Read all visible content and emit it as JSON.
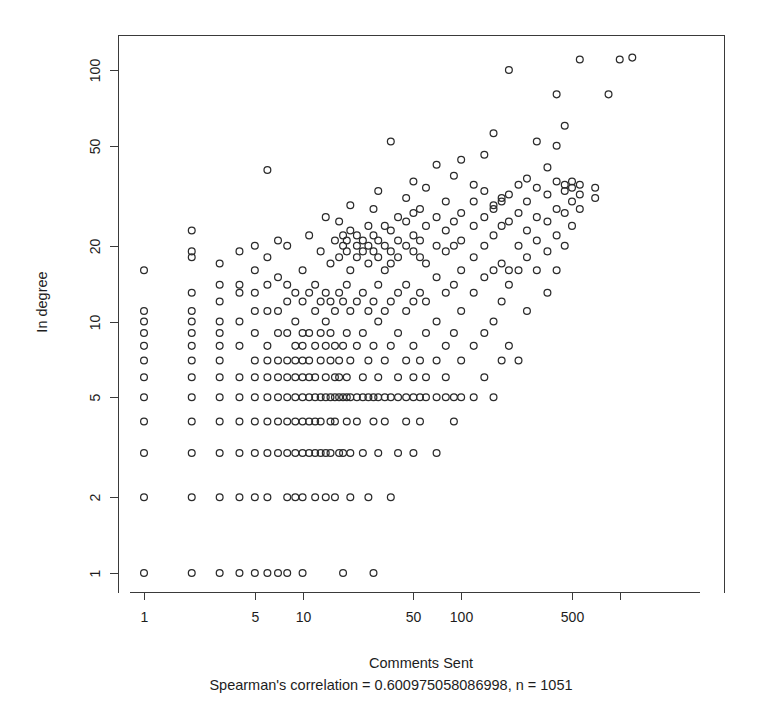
{
  "chart_data": {
    "type": "scatter",
    "title": "",
    "xlabel": "Comments Sent",
    "ylabel": "In degree",
    "subtitle": "Spearman's correlation = 0.600975058086998, n = 1051",
    "xscale": "log",
    "yscale": "log",
    "xlim": [
      0.8,
      1400
    ],
    "ylim": [
      0.85,
      145
    ],
    "xticks": [
      1,
      5,
      10,
      50,
      100,
      500
    ],
    "xtick_labels": [
      "1",
      "5",
      "10",
      "50",
      "100",
      "500"
    ],
    "yticks": [
      1,
      2,
      5,
      10,
      20,
      50,
      100
    ],
    "ytick_labels": [
      "1",
      "2",
      "5",
      "10",
      "20",
      "50",
      "100"
    ],
    "grid": false,
    "legend": false,
    "marker": "open-circle",
    "marker_color": "#2b2b2b",
    "n_points_reported": 1051,
    "spearman_correlation": 0.600975058086998,
    "points": [
      [
        1,
        1
      ],
      [
        1,
        2
      ],
      [
        1,
        3
      ],
      [
        1,
        4
      ],
      [
        1,
        5
      ],
      [
        1,
        6
      ],
      [
        1,
        7
      ],
      [
        1,
        8
      ],
      [
        1,
        9
      ],
      [
        1,
        10
      ],
      [
        1,
        11
      ],
      [
        1,
        16
      ],
      [
        2,
        1
      ],
      [
        2,
        2
      ],
      [
        2,
        3
      ],
      [
        2,
        4
      ],
      [
        2,
        5
      ],
      [
        2,
        6
      ],
      [
        2,
        7
      ],
      [
        2,
        8
      ],
      [
        2,
        9
      ],
      [
        2,
        10
      ],
      [
        2,
        11
      ],
      [
        2,
        13
      ],
      [
        2,
        18
      ],
      [
        2,
        19
      ],
      [
        2,
        23
      ],
      [
        3,
        1
      ],
      [
        3,
        2
      ],
      [
        3,
        3
      ],
      [
        3,
        4
      ],
      [
        3,
        5
      ],
      [
        3,
        6
      ],
      [
        3,
        7
      ],
      [
        3,
        8
      ],
      [
        3,
        9
      ],
      [
        3,
        10
      ],
      [
        3,
        12
      ],
      [
        3,
        14
      ],
      [
        3,
        17
      ],
      [
        4,
        1
      ],
      [
        4,
        2
      ],
      [
        4,
        3
      ],
      [
        4,
        4
      ],
      [
        4,
        5
      ],
      [
        4,
        6
      ],
      [
        4,
        8
      ],
      [
        4,
        10
      ],
      [
        4,
        13
      ],
      [
        4,
        14
      ],
      [
        4,
        19
      ],
      [
        5,
        1
      ],
      [
        5,
        2
      ],
      [
        5,
        3
      ],
      [
        5,
        4
      ],
      [
        5,
        5
      ],
      [
        5,
        6
      ],
      [
        5,
        7
      ],
      [
        5,
        9
      ],
      [
        5,
        11
      ],
      [
        5,
        13
      ],
      [
        5,
        16
      ],
      [
        5,
        20
      ],
      [
        6,
        1
      ],
      [
        6,
        2
      ],
      [
        6,
        3
      ],
      [
        6,
        4
      ],
      [
        6,
        5
      ],
      [
        6,
        6
      ],
      [
        6,
        7
      ],
      [
        6,
        8
      ],
      [
        6,
        11
      ],
      [
        6,
        14
      ],
      [
        6,
        18
      ],
      [
        6,
        40
      ],
      [
        7,
        1
      ],
      [
        7,
        3
      ],
      [
        7,
        4
      ],
      [
        7,
        5
      ],
      [
        7,
        6
      ],
      [
        7,
        7
      ],
      [
        7,
        9
      ],
      [
        7,
        11
      ],
      [
        7,
        15
      ],
      [
        7,
        21
      ],
      [
        8,
        1
      ],
      [
        8,
        2
      ],
      [
        8,
        3
      ],
      [
        8,
        4
      ],
      [
        8,
        5
      ],
      [
        8,
        6
      ],
      [
        8,
        7
      ],
      [
        8,
        9
      ],
      [
        8,
        12
      ],
      [
        8,
        14
      ],
      [
        8,
        20
      ],
      [
        9,
        2
      ],
      [
        9,
        3
      ],
      [
        9,
        4
      ],
      [
        9,
        5
      ],
      [
        9,
        6
      ],
      [
        9,
        7
      ],
      [
        9,
        8
      ],
      [
        9,
        10
      ],
      [
        9,
        13
      ],
      [
        10,
        1
      ],
      [
        10,
        2
      ],
      [
        10,
        3
      ],
      [
        10,
        4
      ],
      [
        10,
        5
      ],
      [
        10,
        6
      ],
      [
        10,
        7
      ],
      [
        10,
        8
      ],
      [
        10,
        9
      ],
      [
        10,
        12
      ],
      [
        10,
        16
      ],
      [
        11,
        3
      ],
      [
        11,
        4
      ],
      [
        11,
        5
      ],
      [
        11,
        6
      ],
      [
        11,
        7
      ],
      [
        11,
        9
      ],
      [
        11,
        13
      ],
      [
        11,
        22
      ],
      [
        12,
        2
      ],
      [
        12,
        3
      ],
      [
        12,
        4
      ],
      [
        12,
        5
      ],
      [
        12,
        6
      ],
      [
        12,
        8
      ],
      [
        12,
        11
      ],
      [
        12,
        14
      ],
      [
        13,
        3
      ],
      [
        13,
        4
      ],
      [
        13,
        5
      ],
      [
        13,
        7
      ],
      [
        13,
        9
      ],
      [
        13,
        12
      ],
      [
        13,
        19
      ],
      [
        14,
        2
      ],
      [
        14,
        3
      ],
      [
        14,
        5
      ],
      [
        14,
        6
      ],
      [
        14,
        8
      ],
      [
        14,
        10
      ],
      [
        14,
        13
      ],
      [
        14,
        26
      ],
      [
        15,
        3
      ],
      [
        15,
        4
      ],
      [
        15,
        5
      ],
      [
        15,
        7
      ],
      [
        15,
        9
      ],
      [
        15,
        12
      ],
      [
        15,
        17
      ],
      [
        16,
        2
      ],
      [
        16,
        4
      ],
      [
        16,
        5
      ],
      [
        16,
        6
      ],
      [
        16,
        8
      ],
      [
        16,
        11
      ],
      [
        16,
        21
      ],
      [
        17,
        3
      ],
      [
        17,
        5
      ],
      [
        17,
        6
      ],
      [
        17,
        7
      ],
      [
        17,
        13
      ],
      [
        17,
        18
      ],
      [
        17,
        25
      ],
      [
        18,
        1
      ],
      [
        18,
        3
      ],
      [
        18,
        5
      ],
      [
        18,
        8
      ],
      [
        18,
        12
      ],
      [
        18,
        20
      ],
      [
        18,
        22
      ],
      [
        19,
        4
      ],
      [
        19,
        5
      ],
      [
        19,
        6
      ],
      [
        19,
        9
      ],
      [
        19,
        14
      ],
      [
        19,
        19
      ],
      [
        19,
        21
      ],
      [
        20,
        2
      ],
      [
        20,
        3
      ],
      [
        20,
        5
      ],
      [
        20,
        7
      ],
      [
        20,
        11
      ],
      [
        20,
        16
      ],
      [
        20,
        23
      ],
      [
        20,
        29
      ],
      [
        22,
        4
      ],
      [
        22,
        5
      ],
      [
        22,
        8
      ],
      [
        22,
        12
      ],
      [
        22,
        18
      ],
      [
        22,
        20
      ],
      [
        22,
        22
      ],
      [
        24,
        3
      ],
      [
        24,
        5
      ],
      [
        24,
        6
      ],
      [
        24,
        9
      ],
      [
        24,
        13
      ],
      [
        24,
        19
      ],
      [
        24,
        21
      ],
      [
        26,
        2
      ],
      [
        26,
        5
      ],
      [
        26,
        7
      ],
      [
        26,
        11
      ],
      [
        26,
        17
      ],
      [
        26,
        20
      ],
      [
        26,
        24
      ],
      [
        28,
        1
      ],
      [
        28,
        4
      ],
      [
        28,
        5
      ],
      [
        28,
        8
      ],
      [
        28,
        12
      ],
      [
        28,
        19
      ],
      [
        28,
        22
      ],
      [
        28,
        28
      ],
      [
        30,
        3
      ],
      [
        30,
        5
      ],
      [
        30,
        6
      ],
      [
        30,
        10
      ],
      [
        30,
        14
      ],
      [
        30,
        18
      ],
      [
        30,
        21
      ],
      [
        30,
        33
      ],
      [
        33,
        4
      ],
      [
        33,
        5
      ],
      [
        33,
        7
      ],
      [
        33,
        11
      ],
      [
        33,
        16
      ],
      [
        33,
        20
      ],
      [
        33,
        24
      ],
      [
        36,
        2
      ],
      [
        36,
        5
      ],
      [
        36,
        8
      ],
      [
        36,
        12
      ],
      [
        36,
        17
      ],
      [
        36,
        19
      ],
      [
        36,
        23
      ],
      [
        36,
        52
      ],
      [
        40,
        3
      ],
      [
        40,
        5
      ],
      [
        40,
        6
      ],
      [
        40,
        9
      ],
      [
        40,
        13
      ],
      [
        40,
        18
      ],
      [
        40,
        21
      ],
      [
        40,
        26
      ],
      [
        45,
        4
      ],
      [
        45,
        5
      ],
      [
        45,
        7
      ],
      [
        45,
        11
      ],
      [
        45,
        14
      ],
      [
        45,
        20
      ],
      [
        45,
        25
      ],
      [
        45,
        31
      ],
      [
        50,
        3
      ],
      [
        50,
        5
      ],
      [
        50,
        6
      ],
      [
        50,
        8
      ],
      [
        50,
        12
      ],
      [
        50,
        19
      ],
      [
        50,
        22
      ],
      [
        50,
        27
      ],
      [
        50,
        36
      ],
      [
        55,
        4
      ],
      [
        55,
        5
      ],
      [
        55,
        7
      ],
      [
        55,
        13
      ],
      [
        55,
        18
      ],
      [
        55,
        21
      ],
      [
        55,
        28
      ],
      [
        60,
        5
      ],
      [
        60,
        6
      ],
      [
        60,
        9
      ],
      [
        60,
        12
      ],
      [
        60,
        17
      ],
      [
        60,
        24
      ],
      [
        60,
        34
      ],
      [
        70,
        3
      ],
      [
        70,
        5
      ],
      [
        70,
        7
      ],
      [
        70,
        10
      ],
      [
        70,
        15
      ],
      [
        70,
        20
      ],
      [
        70,
        26
      ],
      [
        70,
        42
      ],
      [
        80,
        5
      ],
      [
        80,
        6
      ],
      [
        80,
        8
      ],
      [
        80,
        13
      ],
      [
        80,
        19
      ],
      [
        80,
        23
      ],
      [
        80,
        30
      ],
      [
        90,
        4
      ],
      [
        90,
        5
      ],
      [
        90,
        9
      ],
      [
        90,
        14
      ],
      [
        90,
        20
      ],
      [
        90,
        25
      ],
      [
        90,
        38
      ],
      [
        100,
        5
      ],
      [
        100,
        7
      ],
      [
        100,
        11
      ],
      [
        100,
        16
      ],
      [
        100,
        21
      ],
      [
        100,
        27
      ],
      [
        100,
        44
      ],
      [
        120,
        5
      ],
      [
        120,
        8
      ],
      [
        120,
        13
      ],
      [
        120,
        18
      ],
      [
        120,
        24
      ],
      [
        120,
        30
      ],
      [
        120,
        35
      ],
      [
        140,
        6
      ],
      [
        140,
        9
      ],
      [
        140,
        15
      ],
      [
        140,
        20
      ],
      [
        140,
        26
      ],
      [
        140,
        33
      ],
      [
        140,
        46
      ],
      [
        160,
        5
      ],
      [
        160,
        10
      ],
      [
        160,
        16
      ],
      [
        160,
        22
      ],
      [
        160,
        28
      ],
      [
        160,
        29
      ],
      [
        160,
        56
      ],
      [
        180,
        7
      ],
      [
        180,
        12
      ],
      [
        180,
        17
      ],
      [
        180,
        24
      ],
      [
        180,
        30
      ],
      [
        180,
        31
      ],
      [
        200,
        8
      ],
      [
        200,
        14
      ],
      [
        200,
        16
      ],
      [
        200,
        25
      ],
      [
        200,
        32
      ],
      [
        200,
        100
      ],
      [
        230,
        7
      ],
      [
        230,
        16
      ],
      [
        230,
        20
      ],
      [
        230,
        27
      ],
      [
        230,
        35
      ],
      [
        260,
        11
      ],
      [
        260,
        18
      ],
      [
        260,
        23
      ],
      [
        260,
        30
      ],
      [
        260,
        37
      ],
      [
        300,
        16
      ],
      [
        300,
        21
      ],
      [
        300,
        26
      ],
      [
        300,
        34
      ],
      [
        300,
        52
      ],
      [
        350,
        13
      ],
      [
        350,
        19
      ],
      [
        350,
        25
      ],
      [
        350,
        32
      ],
      [
        350,
        41
      ],
      [
        400,
        16
      ],
      [
        400,
        22
      ],
      [
        400,
        28
      ],
      [
        400,
        36
      ],
      [
        400,
        50
      ],
      [
        400,
        80
      ],
      [
        450,
        20
      ],
      [
        450,
        27
      ],
      [
        450,
        33
      ],
      [
        450,
        35
      ],
      [
        450,
        60
      ],
      [
        500,
        24
      ],
      [
        500,
        30
      ],
      [
        500,
        34
      ],
      [
        500,
        36
      ],
      [
        560,
        28
      ],
      [
        560,
        32
      ],
      [
        560,
        35
      ],
      [
        560,
        110
      ],
      [
        700,
        31
      ],
      [
        700,
        34
      ],
      [
        850,
        80
      ],
      [
        1000,
        110
      ],
      [
        1200,
        112
      ]
    ]
  },
  "axes": {
    "y_title": "In degree",
    "x_title": "Comments Sent",
    "caption": "Spearman's correlation = 0.600975058086998, n = 1051"
  }
}
